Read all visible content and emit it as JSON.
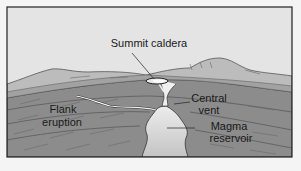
{
  "diagram": {
    "type": "volcano-cross-section",
    "labels": {
      "summit_caldera": "Summit caldera",
      "flank_eruption_line1": "Flank",
      "flank_eruption_line2": "eruption",
      "central_vent_line1": "Central",
      "central_vent_line2": "vent",
      "magma_reservoir_line1": "Magma",
      "magma_reservoir_line2": "reservoir"
    },
    "colors": {
      "background": "#f4f4f4",
      "sky": "#e4e4e4",
      "mountain_surface": "#bcbcbc",
      "rock_layers": "#8c8c8c",
      "rock_dark": "#6a6a6a",
      "magma": "#d4d4d4",
      "conduit": "#f0f0f0",
      "frame": "#222222"
    }
  }
}
